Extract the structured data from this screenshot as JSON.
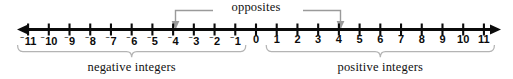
{
  "figure": {
    "width": 513,
    "height": 79,
    "background": "#ffffff",
    "ink": "#0b0b0b",
    "annotation_color": "#9a9a9a"
  },
  "number_line": {
    "min": -11,
    "max": 11,
    "zero_label": "0",
    "left_arrow": "left-arrowhead",
    "right_arrow": "right-arrowhead",
    "negative_sign_glyph": "⁻",
    "ticks": [
      {
        "value": -11,
        "label": "11",
        "negative": true
      },
      {
        "value": -10,
        "label": "10",
        "negative": true
      },
      {
        "value": -9,
        "label": "9",
        "negative": true
      },
      {
        "value": -8,
        "label": "8",
        "negative": true
      },
      {
        "value": -7,
        "label": "7",
        "negative": true
      },
      {
        "value": -6,
        "label": "6",
        "negative": true
      },
      {
        "value": -5,
        "label": "5",
        "negative": true
      },
      {
        "value": -4,
        "label": "4",
        "negative": true
      },
      {
        "value": -3,
        "label": "3",
        "negative": true
      },
      {
        "value": -2,
        "label": "2",
        "negative": true
      },
      {
        "value": -1,
        "label": "1",
        "negative": true
      },
      {
        "value": 0,
        "label": "0",
        "negative": false
      },
      {
        "value": 1,
        "label": "1",
        "negative": false
      },
      {
        "value": 2,
        "label": "2",
        "negative": false
      },
      {
        "value": 3,
        "label": "3",
        "negative": false
      },
      {
        "value": 4,
        "label": "4",
        "negative": false
      },
      {
        "value": 5,
        "label": "5",
        "negative": false
      },
      {
        "value": 6,
        "label": "6",
        "negative": false
      },
      {
        "value": 7,
        "label": "7",
        "negative": false
      },
      {
        "value": 8,
        "label": "8",
        "negative": false
      },
      {
        "value": 9,
        "label": "9",
        "negative": false
      },
      {
        "value": 10,
        "label": "10",
        "negative": false
      },
      {
        "value": 11,
        "label": "11",
        "negative": false
      }
    ]
  },
  "annotations": {
    "opposites": {
      "label": "opposites",
      "from_value": -4,
      "to_value": 4,
      "arrow_icon": "arrow-down-icon"
    },
    "groups": [
      {
        "id": "negative-integers",
        "label": "negative integers",
        "from_value": -11,
        "to_value": -1,
        "brace_icon": "curly-brace-icon"
      },
      {
        "id": "positive-integers",
        "label": "positive integers",
        "from_value": 1,
        "to_value": 11,
        "brace_icon": "curly-brace-icon"
      }
    ]
  },
  "chart_data": {
    "type": "line",
    "xlabel": "",
    "ylabel": "",
    "xlim": [
      -11,
      11
    ],
    "categories": [
      -11,
      -10,
      -9,
      -8,
      -7,
      -6,
      -5,
      -4,
      -3,
      -2,
      -1,
      0,
      1,
      2,
      3,
      4,
      5,
      6,
      7,
      8,
      9,
      10,
      11
    ],
    "tick_labels": [
      "⁻11",
      "⁻10",
      "⁻9",
      "⁻8",
      "⁻7",
      "⁻6",
      "⁻5",
      "⁻4",
      "⁻3",
      "⁻2",
      "⁻1",
      "0",
      "1",
      "2",
      "3",
      "4",
      "5",
      "6",
      "7",
      "8",
      "9",
      "10",
      "11"
    ],
    "grid": false,
    "legend": "none",
    "annotations": [
      {
        "text": "opposites",
        "span": [
          -4,
          4
        ]
      },
      {
        "text": "negative integers",
        "span": [
          -11,
          -1
        ]
      },
      {
        "text": "positive integers",
        "span": [
          1,
          11
        ]
      }
    ]
  }
}
